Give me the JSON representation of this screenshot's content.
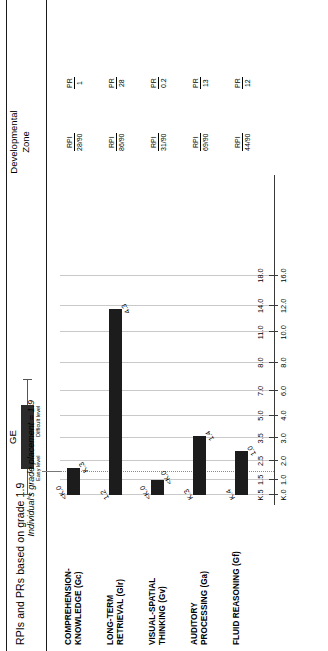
{
  "page": {
    "title": "RPIs and PRs based on grade 1.9"
  },
  "legend": {
    "ge_label": "GE",
    "easy_label": "Easy level",
    "difficult_label": "Difficult level",
    "devzone_line1": "Developmental",
    "devzone_line2": "Zone"
  },
  "annotation": {
    "grade_placement": "Individual's grade placement = 1.9",
    "grade_placement_value": 1.9
  },
  "stats_headers": {
    "rpi": "RPI",
    "pr": "PR"
  },
  "rows": [
    {
      "name": "COMPREHENSION-\nKNOWLEDGE (Gc)",
      "low_label": "<K.0",
      "high_label": "K.3",
      "rpi": "28/90",
      "pr": "1"
    },
    {
      "name": "LONG-TERM\nRETRIEVAL (Glr)",
      "low_label": "1.2",
      "high_label": "4.3",
      "rpi": "86/90",
      "pr": "28"
    },
    {
      "name": "VISUAL-SPATIAL\nTHINKING (Gv)",
      "low_label": "<K.0",
      "high_label": "<K.0",
      "rpi": "31/90",
      "pr": "0.2"
    },
    {
      "name": "AUDITORY\nPROCESSING (Ga)",
      "low_label": "K.3",
      "high_label": "1.4",
      "rpi": "69/90",
      "pr": "13"
    },
    {
      "name": "FLUID REASONING (Gf)",
      "low_label": "K.4",
      "high_label": "1.0",
      "rpi": "44/90",
      "pr": "12"
    }
  ],
  "chart_data": {
    "type": "bar",
    "title": "RPIs and PRs based on grade 1.9",
    "xlabel": "Grade Equivalent (GE)",
    "ylabel": "",
    "orientation": "horizontal",
    "grid": true,
    "legend_position": "top",
    "axis_upper_ticks": [
      "K.5",
      "1.5",
      "2.5",
      "3.5",
      "5.0",
      "7.0",
      "8.0",
      "11.0",
      "14.0",
      "18.0"
    ],
    "axis_lower_ticks": [
      "K.0",
      "1.0",
      "2.0",
      "3.0",
      "4.0",
      "6.0",
      "8.0",
      "10.0",
      "12.0",
      "16.0"
    ],
    "axis_scale_positions": [
      0,
      8,
      18,
      30,
      42,
      55,
      70,
      86,
      100,
      116
    ],
    "reference_line": {
      "label": "Individual's grade placement = 1.9",
      "value": 1.9
    },
    "categories": [
      "COMPREHENSION-KNOWLEDGE (Gc)",
      "LONG-TERM RETRIEVAL (Glr)",
      "VISUAL-SPATIAL THINKING (Gv)",
      "AUDITORY PROCESSING (Ga)",
      "FLUID REASONING (Gf)"
    ],
    "series": [
      {
        "name": "Developmental Zone (easy level to difficult level)",
        "bands": [
          {
            "low": "<K.0",
            "high": "K.3",
            "low_px": 0,
            "width_px": 18
          },
          {
            "low": "1.2",
            "high": "4.3",
            "low_px": 0,
            "width_px": 126
          },
          {
            "low": "<K.0",
            "high": "<K.0",
            "low_px": 0,
            "width_px": 10
          },
          {
            "low": "K.3",
            "high": "1.4",
            "low_px": 0,
            "width_px": 40
          },
          {
            "low": "K.4",
            "high": "1.0",
            "low_px": 0,
            "width_px": 30
          }
        ]
      }
    ],
    "rpi_values": [
      "28/90",
      "86/90",
      "31/90",
      "69/90",
      "44/90"
    ],
    "pr_values": [
      "1",
      "28",
      "0.2",
      "13",
      "12"
    ]
  }
}
